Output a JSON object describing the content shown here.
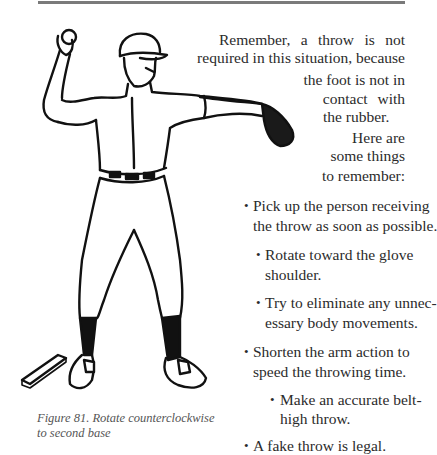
{
  "page": {
    "intro_lines": [
      "Remember, a throw is not",
      "required in this situation, because",
      "the foot is not in",
      "contact with",
      "the rubber.",
      "Here are",
      "some things",
      "to remember:"
    ],
    "bullets": [
      {
        "lines": [
          "Pick up the person receiving",
          "the throw as soon as possible."
        ]
      },
      {
        "lines": [
          "Rotate toward the glove",
          "shoulder."
        ]
      },
      {
        "lines": [
          "Try to eliminate any unnec-",
          "essary body movements."
        ]
      },
      {
        "lines": [
          "Shorten the arm action to",
          "speed the throwing time."
        ]
      },
      {
        "lines": [
          "Make an accurate belt-",
          "high throw."
        ]
      },
      {
        "lines": [
          "A fake throw is legal."
        ]
      }
    ],
    "bullet_glyph": "•",
    "figure": {
      "caption_lines": [
        "Figure 81. Rotate counterclockwise",
        "to second base"
      ],
      "illustration": "pitcher-throwing-illustration"
    }
  }
}
